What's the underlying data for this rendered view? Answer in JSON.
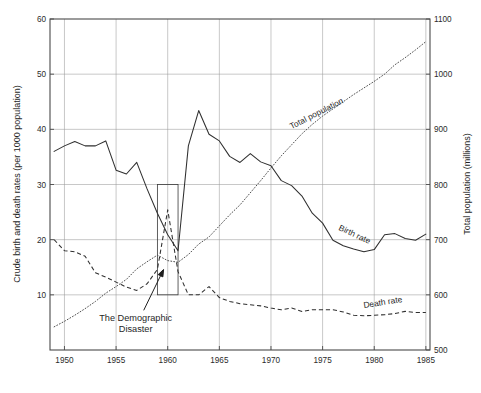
{
  "chart_data": {
    "type": "line",
    "title": "",
    "xlabel": "",
    "ylabel": "Crude birth and death rates (per 1000 population)",
    "y2label": "Total population (millions)",
    "xlim": [
      1948.6,
      1985.4
    ],
    "ylim": [
      0,
      60
    ],
    "y2lim": [
      500,
      1100
    ],
    "grid": true,
    "legend": "inline-labels",
    "xticks": [
      "1950",
      "1955",
      "1960",
      "1965",
      "1970",
      "1975",
      "1980",
      "1985"
    ],
    "xtick_values": [
      1950,
      1955,
      1960,
      1965,
      1970,
      1975,
      1980,
      1985
    ],
    "yticks": [
      "10",
      "20",
      "30",
      "40",
      "50",
      "60"
    ],
    "ytick_values": [
      10,
      20,
      30,
      40,
      50,
      60
    ],
    "y2ticks": [
      "500",
      "600",
      "700",
      "800",
      "900",
      "1000",
      "1100"
    ],
    "y2tick_values": [
      500,
      600,
      700,
      800,
      900,
      1000,
      1100
    ],
    "x": [
      1949,
      1950,
      1951,
      1952,
      1953,
      1954,
      1955,
      1956,
      1957,
      1958,
      1959,
      1960,
      1961,
      1962,
      1963,
      1964,
      1965,
      1966,
      1967,
      1968,
      1969,
      1970,
      1971,
      1972,
      1973,
      1974,
      1975,
      1976,
      1977,
      1978,
      1979,
      1980,
      1981,
      1982,
      1983,
      1984,
      1985
    ],
    "series": [
      {
        "name": "Birth rate",
        "axis": "left",
        "style": "solid",
        "label_x": 1976.5,
        "label_y": 21.8,
        "values": [
          36.0,
          37.0,
          37.8,
          37.0,
          37.0,
          37.9,
          32.6,
          31.9,
          34.0,
          29.2,
          24.8,
          20.9,
          18.0,
          37.0,
          43.4,
          39.1,
          37.9,
          35.1,
          34.0,
          35.6,
          34.1,
          33.4,
          30.7,
          29.8,
          27.9,
          24.8,
          23.0,
          19.9,
          18.9,
          18.3,
          17.8,
          18.2,
          20.9,
          21.1,
          20.2,
          19.9,
          21.0
        ]
      },
      {
        "name": "Death rate",
        "axis": "left",
        "style": "dashed",
        "label_x": 1979.0,
        "label_y": 7.6,
        "values": [
          20.0,
          18.0,
          17.8,
          17.0,
          14.0,
          13.2,
          12.3,
          11.4,
          10.8,
          12.0,
          14.6,
          25.4,
          14.2,
          10.0,
          10.0,
          11.5,
          9.5,
          8.8,
          8.4,
          8.2,
          8.0,
          7.6,
          7.3,
          7.6,
          7.0,
          7.3,
          7.3,
          7.3,
          6.9,
          6.3,
          6.2,
          6.3,
          6.4,
          6.6,
          7.0,
          6.8,
          6.8
        ]
      },
      {
        "name": "Total population",
        "axis": "right",
        "style": "dotted",
        "label_x": 1972.0,
        "label_y": 900,
        "values": [
          542,
          552,
          563,
          575,
          588,
          603,
          615,
          628,
          647,
          660,
          672,
          662,
          659,
          673,
          692,
          705,
          725,
          745,
          763,
          785,
          807,
          830,
          852,
          872,
          892,
          909,
          924,
          937,
          950,
          963,
          975,
          987,
          1000,
          1017,
          1030,
          1044,
          1059
        ]
      }
    ],
    "annotations": [
      {
        "kind": "text-arrow",
        "text_line1": "The Demographic",
        "text_line2": "Disaster",
        "text_x": 1956.9,
        "text_y": 5.2,
        "arrow_to_x": 1959.6,
        "arrow_to_y": 14.6
      },
      {
        "kind": "rect",
        "name": "famine-highlight-box",
        "x0": 1959,
        "x1": 1961,
        "y0": 10,
        "y1": 30
      }
    ]
  }
}
